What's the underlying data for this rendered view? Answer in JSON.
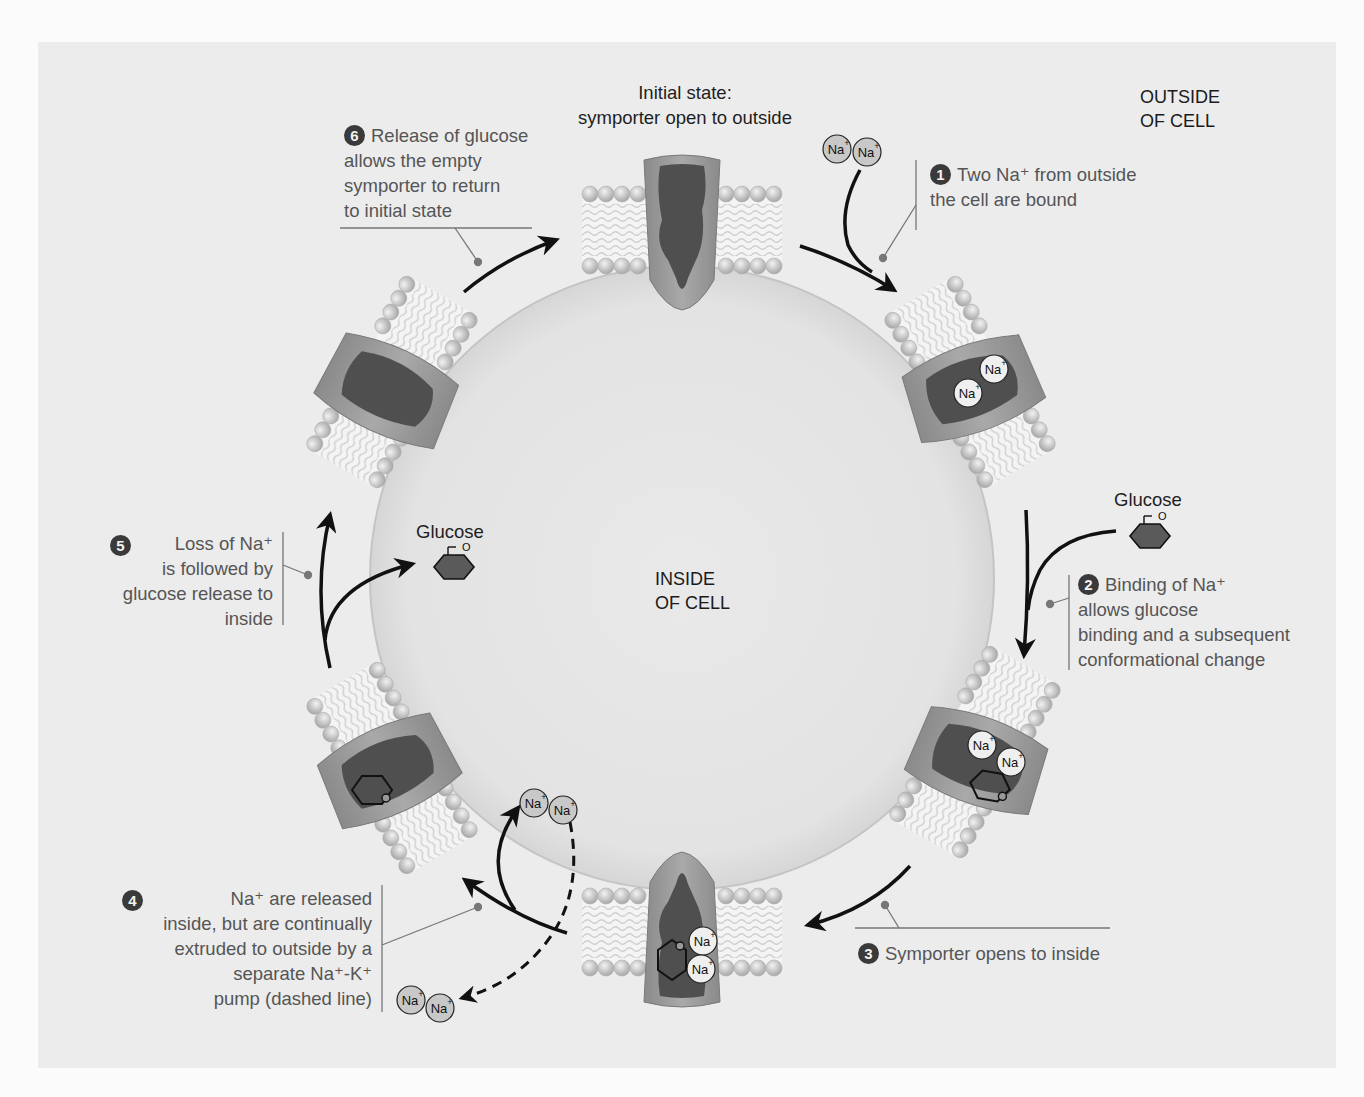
{
  "figure": {
    "title_initial": {
      "line1": "Initial state:",
      "line2": "symporter open to outside"
    },
    "regions": {
      "outside": {
        "line1": "OUTSIDE",
        "line2": "OF CELL"
      },
      "inside": {
        "line1": "INSIDE",
        "line2": "OF CELL"
      }
    },
    "molecules": {
      "glucose_label": "Glucose",
      "sodium_label": "Na",
      "sodium_charge": "+",
      "ring_oxygen": "O"
    },
    "steps": [
      {
        "number": "1",
        "lines": [
          "Two Na⁺ from outside",
          "the cell are bound"
        ]
      },
      {
        "number": "2",
        "lines": [
          "Binding of Na⁺",
          "allows glucose",
          "binding and a subsequent",
          "conformational change"
        ]
      },
      {
        "number": "3",
        "lines": [
          "Symporter opens to inside"
        ]
      },
      {
        "number": "4",
        "lines": [
          "Na⁺ are released",
          "inside, but are continually",
          "extruded to outside by a",
          "separate Na⁺-K⁺",
          "pump (dashed line)"
        ]
      },
      {
        "number": "5",
        "lines": [
          "Loss of Na⁺",
          "is followed by",
          "glucose release to",
          "inside"
        ]
      },
      {
        "number": "6",
        "lines": [
          "Release of glucose",
          "allows the empty",
          "symporter to return",
          "to initial state"
        ]
      }
    ],
    "colors": {
      "panel_bg": "#ececec",
      "cell_interior": "#e6e6e6",
      "protein_light": "#9c9c9c",
      "protein_dark": "#4a4a4a",
      "lipid_head": "#c9c9c9",
      "arrow": "#111111",
      "leader_line": "#777777",
      "text": "#555555"
    }
  }
}
